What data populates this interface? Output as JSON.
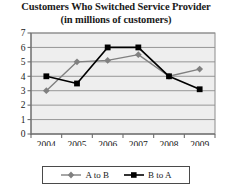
{
  "chart_data": {
    "type": "line",
    "title": "Customers Who Switched Service Provider",
    "subtitle": "(in millions of customers)",
    "title_line1": "Customers Who Switched Service Provider",
    "title_line2": "(in millions of customers)",
    "xlabel": "",
    "ylabel": "",
    "categories": [
      "2004",
      "2005",
      "2006",
      "2007",
      "2008",
      "2009"
    ],
    "x_tick_labels": [
      "2004",
      "2005",
      "2006",
      "2007",
      "2008",
      "2009"
    ],
    "y_tick_labels": [
      "0",
      "1",
      "2",
      "3",
      "4",
      "5",
      "6",
      "7"
    ],
    "y_ticks": [
      0,
      1,
      2,
      3,
      4,
      5,
      6,
      7
    ],
    "ylim": [
      0,
      7
    ],
    "grid": "horizontal",
    "legend_position": "bottom",
    "series": [
      {
        "name": "A to B",
        "marker": "diamond",
        "color": "#808080",
        "values": [
          3.0,
          5.0,
          5.1,
          5.5,
          4.0,
          4.5
        ]
      },
      {
        "name": "B to A",
        "marker": "square",
        "color": "#000000",
        "values": [
          4.0,
          3.5,
          6.0,
          6.0,
          4.0,
          3.1
        ]
      }
    ]
  },
  "legend": {
    "entries": [
      {
        "label": "A to B",
        "color": "#808080",
        "marker": "diamond"
      },
      {
        "label": "B to A",
        "color": "#000000",
        "marker": "square"
      }
    ]
  },
  "colors": {
    "series_a_to_b": "#808080",
    "series_b_to_a": "#000000",
    "plot_background": "#eeeeee",
    "gridline": "#8c8c8c",
    "axis": "#6e6e6e",
    "text": "#1a1a1a"
  }
}
